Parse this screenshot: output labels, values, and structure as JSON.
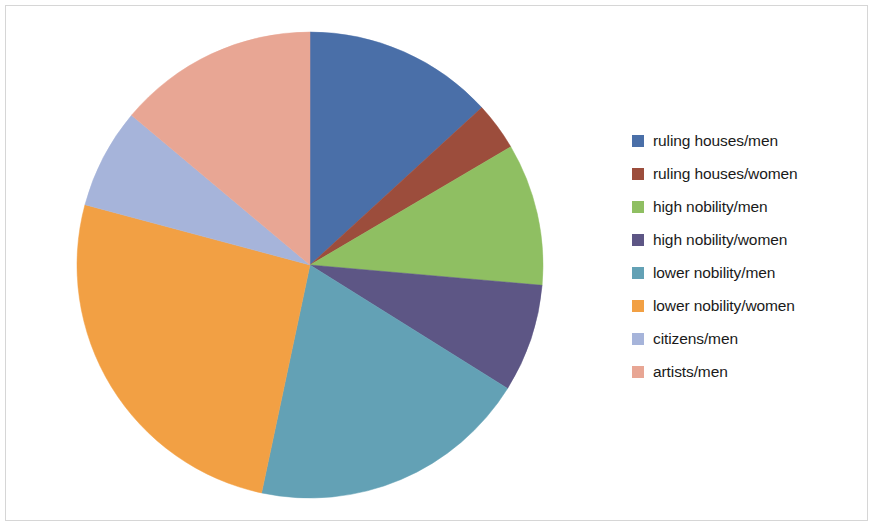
{
  "chart_data": {
    "type": "pie",
    "title": "",
    "subtitle": "",
    "xlabel": "",
    "ylabel": "",
    "grid": false,
    "legend_position": "right",
    "start_angle_deg": 0,
    "direction": "clockwise",
    "center": {
      "x": 310,
      "y": 265
    },
    "radius": 233,
    "categories": [
      "ruling houses/men",
      "ruling houses/women",
      "high nobility/men",
      "high nobility/women",
      "lower nobility/men",
      "lower nobility/women",
      "citizens/men",
      "artists/men"
    ],
    "values": [
      13.2,
      3.3,
      9.9,
      7.5,
      19.4,
      25.8,
      6.9,
      13.9
    ],
    "unit": "percent",
    "angles_deg": [
      47.5,
      12.0,
      35.5,
      27.0,
      70.0,
      93.0,
      25.0,
      50.0
    ],
    "boundaries_deg": [
      0,
      47.5,
      59.5,
      95,
      122,
      192,
      285,
      310,
      360
    ],
    "colors": [
      "#4a6fa8",
      "#9c4d3c",
      "#8fbf62",
      "#5d5685",
      "#63a1b5",
      "#f2a044",
      "#a6b4da",
      "#e8a694"
    ]
  },
  "legend": {
    "items": [
      {
        "label": "ruling houses/men",
        "color": "#4a6fa8"
      },
      {
        "label": "ruling houses/women",
        "color": "#9c4d3c"
      },
      {
        "label": "high nobility/men",
        "color": "#8fbf62"
      },
      {
        "label": "high nobility/women",
        "color": "#5d5685"
      },
      {
        "label": "lower nobility/men",
        "color": "#63a1b5"
      },
      {
        "label": "lower nobility/women",
        "color": "#f2a044"
      },
      {
        "label": "citizens/men",
        "color": "#a6b4da"
      },
      {
        "label": "artists/men",
        "color": "#e8a694"
      }
    ]
  }
}
